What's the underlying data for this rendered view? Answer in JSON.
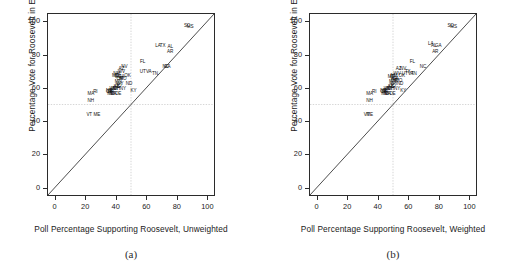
{
  "figure": {
    "panels": [
      {
        "caption": "(a)",
        "xlabel": "Poll Percentage Supporting Roosevelt, Unweighted",
        "ylabel": "Percentage Vote for Roosevelt in Election"
      },
      {
        "caption": "(b)",
        "xlabel": "Poll Percentage Supporting Roosevelt, Weighted",
        "ylabel": "Percentage Vote for Roosevelt in Election"
      }
    ]
  },
  "axis": {
    "xticks": [
      "0",
      "20",
      "40",
      "60",
      "80",
      "100"
    ],
    "yticks": [
      "0",
      "20",
      "40",
      "60",
      "80",
      "100"
    ],
    "xtick_values": [
      0,
      20,
      40,
      60,
      80,
      100
    ],
    "ytick_values": [
      0,
      20,
      40,
      60,
      80,
      100
    ]
  },
  "colors": {
    "frame": "#2b2b2b",
    "identity_line": "#2b2b2b",
    "reference_line": "#b9b9b9",
    "label": "#111111"
  },
  "chart_data": [
    {
      "type": "scatter",
      "title": "(a)",
      "xlabel": "Poll Percentage Supporting Roosevelt, Unweighted",
      "ylabel": "Percentage Vote for Roosevelt in Election",
      "xlim": [
        -5,
        105
      ],
      "ylim": [
        -5,
        105
      ],
      "grid": false,
      "legend": "none",
      "annotations": [
        "identity line y = x",
        "dashed reference line at x = 50",
        "dashed reference line at y = 50"
      ],
      "reference_lines": {
        "vertical_x": 50,
        "horizontal_y": 50,
        "identity": true
      },
      "point_labels": "two-letter US state abbreviations",
      "points": [
        {
          "label": "SC",
          "x": 86,
          "y": 98
        },
        {
          "label": "MS",
          "x": 88,
          "y": 97
        },
        {
          "label": "LA",
          "x": 67,
          "y": 86
        },
        {
          "label": "TX",
          "x": 70,
          "y": 86
        },
        {
          "label": "AL",
          "x": 75,
          "y": 85
        },
        {
          "label": "AR",
          "x": 75,
          "y": 82
        },
        {
          "label": "GA",
          "x": 73,
          "y": 73
        },
        {
          "label": "NC",
          "x": 72,
          "y": 73
        },
        {
          "label": "FL",
          "x": 57,
          "y": 76
        },
        {
          "label": "UT",
          "x": 57,
          "y": 70
        },
        {
          "label": "VA",
          "x": 61,
          "y": 70
        },
        {
          "label": "TN",
          "x": 65,
          "y": 69
        },
        {
          "label": "NV",
          "x": 45,
          "y": 73
        },
        {
          "label": "AZ",
          "x": 43,
          "y": 72
        },
        {
          "label": "WV",
          "x": 43,
          "y": 70
        },
        {
          "label": "NM",
          "x": 40,
          "y": 69
        },
        {
          "label": "MT",
          "x": 39,
          "y": 68
        },
        {
          "label": "ID",
          "x": 40,
          "y": 68
        },
        {
          "label": "OK",
          "x": 47,
          "y": 68
        },
        {
          "label": "WA",
          "x": 41,
          "y": 67
        },
        {
          "label": "CA",
          "x": 43,
          "y": 67
        },
        {
          "label": "OR",
          "x": 42,
          "y": 66
        },
        {
          "label": "MO",
          "x": 44,
          "y": 66
        },
        {
          "label": "MN",
          "x": 41,
          "y": 64
        },
        {
          "label": "WY",
          "x": 42,
          "y": 63
        },
        {
          "label": "ND",
          "x": 48,
          "y": 63
        },
        {
          "label": "CO",
          "x": 41,
          "y": 62
        },
        {
          "label": "KS",
          "x": 40,
          "y": 61
        },
        {
          "label": "IL",
          "x": 41,
          "y": 61
        },
        {
          "label": "OH",
          "x": 40,
          "y": 60
        },
        {
          "label": "MI",
          "x": 39,
          "y": 60
        },
        {
          "label": "IN",
          "x": 38,
          "y": 60
        },
        {
          "label": "WI",
          "x": 37,
          "y": 60
        },
        {
          "label": "NY",
          "x": 44,
          "y": 60
        },
        {
          "label": "IA",
          "x": 36,
          "y": 59
        },
        {
          "label": "NE",
          "x": 35,
          "y": 59
        },
        {
          "label": "SD",
          "x": 36,
          "y": 58
        },
        {
          "label": "PA",
          "x": 38,
          "y": 57
        },
        {
          "label": "NJ",
          "x": 37,
          "y": 57
        },
        {
          "label": "DE",
          "x": 41,
          "y": 57
        },
        {
          "label": "MD",
          "x": 36,
          "y": 57
        },
        {
          "label": "CT",
          "x": 35,
          "y": 58
        },
        {
          "label": "KY",
          "x": 51,
          "y": 59
        },
        {
          "label": "MA",
          "x": 23,
          "y": 57
        },
        {
          "label": "RI",
          "x": 26,
          "y": 58
        },
        {
          "label": "NH",
          "x": 23,
          "y": 53
        },
        {
          "label": "VT",
          "x": 22,
          "y": 44
        },
        {
          "label": "ME",
          "x": 27,
          "y": 44
        }
      ]
    },
    {
      "type": "scatter",
      "title": "(b)",
      "xlabel": "Poll Percentage Supporting Roosevelt, Weighted",
      "ylabel": "Percentage Vote for Roosevelt in Election",
      "xlim": [
        -5,
        105
      ],
      "ylim": [
        -5,
        105
      ],
      "grid": false,
      "legend": "none",
      "annotations": [
        "identity line y = x",
        "dashed reference line at x = 50",
        "dashed reference line at y = 50"
      ],
      "reference_lines": {
        "vertical_x": 50,
        "horizontal_y": 50,
        "identity": true
      },
      "point_labels": "two-letter US state abbreviations",
      "points": [
        {
          "label": "SC",
          "x": 87,
          "y": 98
        },
        {
          "label": "MS",
          "x": 89,
          "y": 97
        },
        {
          "label": "LA",
          "x": 74,
          "y": 87
        },
        {
          "label": "AL",
          "x": 76,
          "y": 86
        },
        {
          "label": "GA",
          "x": 79,
          "y": 86
        },
        {
          "label": "AR",
          "x": 77,
          "y": 82
        },
        {
          "label": "FL",
          "x": 62,
          "y": 76
        },
        {
          "label": "NC",
          "x": 69,
          "y": 73
        },
        {
          "label": "AZ",
          "x": 53,
          "y": 72
        },
        {
          "label": "NV",
          "x": 56,
          "y": 72
        },
        {
          "label": "TX",
          "x": 59,
          "y": 70
        },
        {
          "label": "VA",
          "x": 61,
          "y": 69
        },
        {
          "label": "TN",
          "x": 63,
          "y": 69
        },
        {
          "label": "UT",
          "x": 57,
          "y": 69
        },
        {
          "label": "WV",
          "x": 52,
          "y": 69
        },
        {
          "label": "NM",
          "x": 50,
          "y": 68
        },
        {
          "label": "OK",
          "x": 55,
          "y": 68
        },
        {
          "label": "MT",
          "x": 48,
          "y": 67
        },
        {
          "label": "ID",
          "x": 49,
          "y": 67
        },
        {
          "label": "WA",
          "x": 50,
          "y": 66
        },
        {
          "label": "CA",
          "x": 51,
          "y": 66
        },
        {
          "label": "OR",
          "x": 50,
          "y": 65
        },
        {
          "label": "MO",
          "x": 53,
          "y": 65
        },
        {
          "label": "MN",
          "x": 49,
          "y": 64
        },
        {
          "label": "ND",
          "x": 54,
          "y": 63
        },
        {
          "label": "WY",
          "x": 50,
          "y": 63
        },
        {
          "label": "CO",
          "x": 49,
          "y": 62
        },
        {
          "label": "IL",
          "x": 49,
          "y": 61
        },
        {
          "label": "KS",
          "x": 48,
          "y": 61
        },
        {
          "label": "OH",
          "x": 48,
          "y": 60
        },
        {
          "label": "MI",
          "x": 47,
          "y": 60
        },
        {
          "label": "NY",
          "x": 52,
          "y": 60
        },
        {
          "label": "IN",
          "x": 46,
          "y": 60
        },
        {
          "label": "WI",
          "x": 45,
          "y": 60
        },
        {
          "label": "IA",
          "x": 44,
          "y": 59
        },
        {
          "label": "NE",
          "x": 43,
          "y": 59
        },
        {
          "label": "KY",
          "x": 56,
          "y": 59
        },
        {
          "label": "SD",
          "x": 44,
          "y": 58
        },
        {
          "label": "PA",
          "x": 46,
          "y": 57
        },
        {
          "label": "NJ",
          "x": 45,
          "y": 57
        },
        {
          "label": "MD",
          "x": 44,
          "y": 57
        },
        {
          "label": "DE",
          "x": 49,
          "y": 57
        },
        {
          "label": "CT",
          "x": 43,
          "y": 58
        },
        {
          "label": "RI",
          "x": 37,
          "y": 58
        },
        {
          "label": "MA",
          "x": 34,
          "y": 57
        },
        {
          "label": "NH",
          "x": 34,
          "y": 53
        },
        {
          "label": "VT",
          "x": 32,
          "y": 44
        },
        {
          "label": "ME",
          "x": 34,
          "y": 44
        }
      ]
    }
  ]
}
